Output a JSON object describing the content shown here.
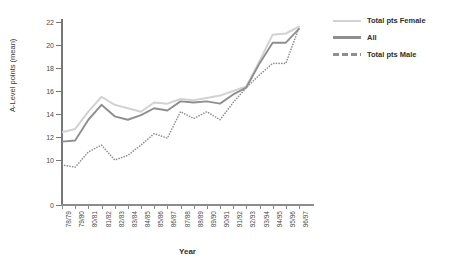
{
  "chart_data": {
    "type": "line",
    "title": "",
    "xlabel": "Year",
    "ylabel": "A-Level points (mean)",
    "categories": [
      "78/79",
      "79/80",
      "80/81",
      "81/82",
      "82/83",
      "83/84",
      "84/85",
      "85/86",
      "86/87",
      "87/88",
      "88/89",
      "89/90",
      "90/91",
      "91/92",
      "92/93",
      "93/94",
      "94/95",
      "95/96",
      "96/97"
    ],
    "ylim": [
      0,
      22
    ],
    "yticks": [
      0,
      10,
      12,
      14,
      16,
      18,
      20,
      22
    ],
    "ytick_labels": [
      "0",
      "10",
      "12",
      "14",
      "16",
      "18",
      "20",
      "22"
    ],
    "axis_break": true,
    "grid": false,
    "legend_position": "right",
    "series": [
      {
        "name": "Total pts Female",
        "color": "#d2d2d2",
        "style": "solid",
        "values": [
          12.4,
          12.7,
          14.2,
          15.5,
          14.8,
          14.5,
          14.2,
          15.0,
          14.9,
          15.3,
          15.2,
          15.4,
          15.6,
          16.0,
          16.4,
          18.6,
          20.9,
          21.0,
          21.6
        ]
      },
      {
        "name": "All",
        "color": "#8f8f8f",
        "style": "solid",
        "values": [
          11.6,
          11.7,
          13.5,
          14.8,
          13.8,
          13.5,
          13.9,
          14.5,
          14.3,
          15.1,
          15.0,
          15.1,
          14.9,
          15.7,
          16.3,
          18.4,
          20.2,
          20.2,
          21.4
        ]
      },
      {
        "name": "Total pts Male",
        "color": "#8f8f8f",
        "style": "dotted",
        "values": [
          8.9,
          8.4,
          10.7,
          11.3,
          10.0,
          10.4,
          11.3,
          12.3,
          11.9,
          14.2,
          13.6,
          14.2,
          13.5,
          15.0,
          16.3,
          17.4,
          18.4,
          18.4,
          21.5
        ]
      }
    ]
  },
  "legend": {
    "items": [
      {
        "label": "Total pts Female"
      },
      {
        "label": "All"
      },
      {
        "label": "Total pts Male"
      }
    ]
  }
}
